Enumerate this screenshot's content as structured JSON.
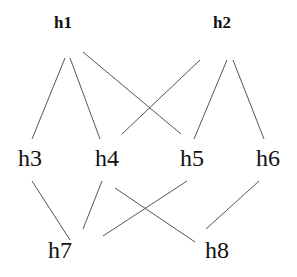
{
  "nodes": [
    {
      "id": "h1",
      "label": "h1",
      "x": 63,
      "y": 22,
      "level": "top"
    },
    {
      "id": "h2",
      "label": "h2",
      "x": 222,
      "y": 22,
      "level": "top"
    },
    {
      "id": "h3",
      "label": "h3",
      "x": 30,
      "y": 158,
      "level": "mid"
    },
    {
      "id": "h4",
      "label": "h4",
      "x": 107,
      "y": 158,
      "level": "mid"
    },
    {
      "id": "h5",
      "label": "h5",
      "x": 192,
      "y": 158,
      "level": "mid"
    },
    {
      "id": "h6",
      "label": "h6",
      "x": 268,
      "y": 158,
      "level": "mid"
    },
    {
      "id": "h7",
      "label": "h7",
      "x": 60,
      "y": 250,
      "level": "mid"
    },
    {
      "id": "h8",
      "label": "h8",
      "x": 217,
      "y": 250,
      "level": "mid"
    }
  ],
  "edges": [
    {
      "from": "h1",
      "to": "h3",
      "x1": 65,
      "y1": 58,
      "x2": 32,
      "y2": 139
    },
    {
      "from": "h1",
      "to": "h4",
      "x1": 70,
      "y1": 58,
      "x2": 100,
      "y2": 139
    },
    {
      "from": "h1",
      "to": "h5",
      "x1": 83,
      "y1": 52,
      "x2": 181,
      "y2": 134
    },
    {
      "from": "h2",
      "to": "h4",
      "x1": 200,
      "y1": 60,
      "x2": 122,
      "y2": 134
    },
    {
      "from": "h2",
      "to": "h5",
      "x1": 227,
      "y1": 60,
      "x2": 194,
      "y2": 139
    },
    {
      "from": "h2",
      "to": "h6",
      "x1": 233,
      "y1": 60,
      "x2": 264,
      "y2": 139
    },
    {
      "from": "h3",
      "to": "h7",
      "x1": 32,
      "y1": 181,
      "x2": 70,
      "y2": 240
    },
    {
      "from": "h4",
      "to": "h7",
      "x1": 102,
      "y1": 181,
      "x2": 83,
      "y2": 229
    },
    {
      "from": "h5",
      "to": "h7",
      "x1": 187,
      "y1": 181,
      "x2": 103,
      "y2": 236
    },
    {
      "from": "h4",
      "to": "h8",
      "x1": 115,
      "y1": 188,
      "x2": 195,
      "y2": 242
    },
    {
      "from": "h6",
      "to": "h8",
      "x1": 259,
      "y1": 181,
      "x2": 206,
      "y2": 229
    }
  ],
  "colors": {
    "line": "#555555",
    "text": "#111111",
    "background": "#ffffff"
  }
}
